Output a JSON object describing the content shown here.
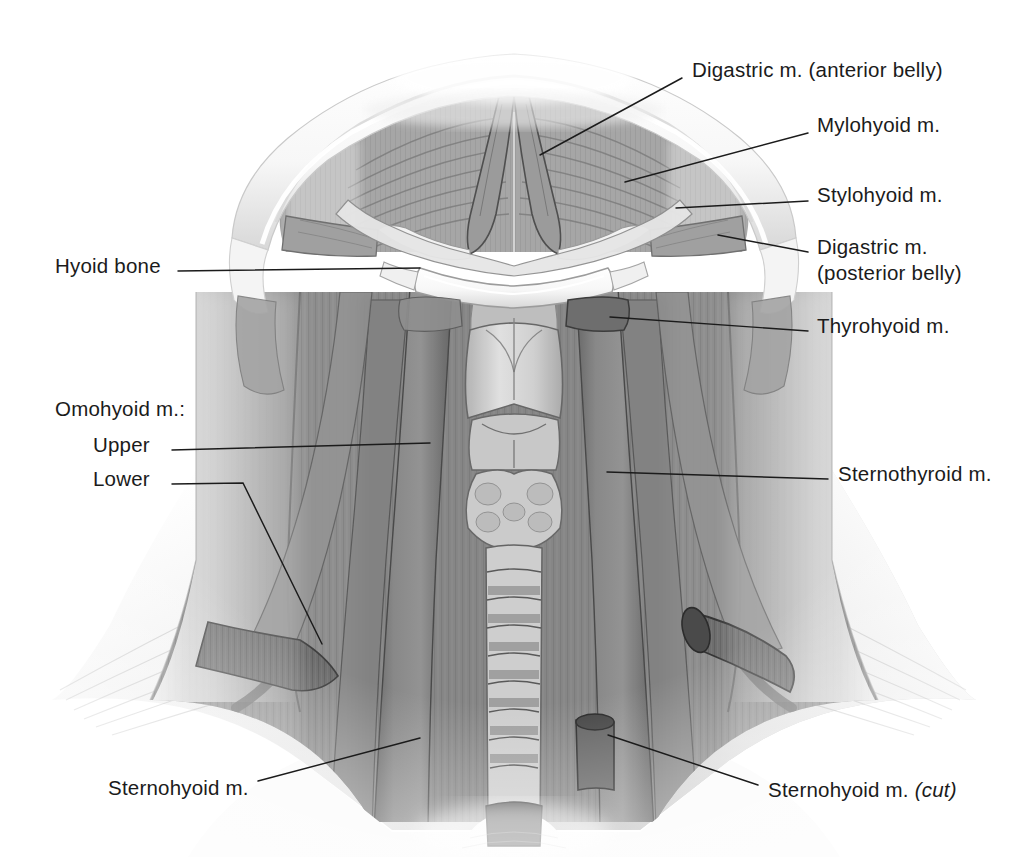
{
  "figure": {
    "background_color": "#ffffff",
    "ink_color": "#1b1b1b",
    "style": "grayscale medical illustration"
  },
  "labels": [
    {
      "id": "digastric-anterior",
      "text": "Digastric m. (anterior belly)",
      "side": "right",
      "x": 692,
      "y": 57,
      "leader": [
        [
          682,
          78
        ],
        [
          540,
          155
        ]
      ]
    },
    {
      "id": "mylohyoid",
      "text": "Mylohyoid m.",
      "side": "right",
      "x": 817,
      "y": 112,
      "leader": [
        [
          808,
          133
        ],
        [
          625,
          182
        ]
      ]
    },
    {
      "id": "stylohyoid",
      "text": "Stylohyoid m.",
      "side": "right",
      "x": 817,
      "y": 182,
      "leader": [
        [
          808,
          201
        ],
        [
          676,
          208
        ]
      ]
    },
    {
      "id": "digastric-posterior",
      "text": "Digastric m.",
      "text_line2": "(posterior belly)",
      "side": "right",
      "x": 817,
      "y": 234,
      "leader": [
        [
          808,
          252
        ],
        [
          718,
          235
        ]
      ]
    },
    {
      "id": "thyrohyoid",
      "text": "Thyrohyoid m.",
      "side": "right",
      "x": 817,
      "y": 313,
      "leader": [
        [
          808,
          331
        ],
        [
          610,
          317
        ]
      ]
    },
    {
      "id": "sternothyroid",
      "text": "Sternothyroid m.",
      "side": "right",
      "x": 838,
      "y": 461,
      "leader": [
        [
          828,
          479
        ],
        [
          607,
          472
        ]
      ]
    },
    {
      "id": "hyoid-bone",
      "text": "Hyoid bone",
      "side": "left",
      "x": 55,
      "y": 253,
      "leader": [
        [
          178,
          271
        ],
        [
          420,
          268
        ]
      ]
    },
    {
      "id": "omohyoid-group",
      "text": "Omohyoid m.:",
      "side": "left",
      "x": 55,
      "y": 396,
      "leader": null
    },
    {
      "id": "omohyoid-upper",
      "text": "Upper",
      "side": "left",
      "x": 93,
      "y": 432,
      "leader": [
        [
          172,
          450
        ],
        [
          430,
          443
        ]
      ]
    },
    {
      "id": "omohyoid-lower",
      "text": "Lower",
      "side": "left",
      "x": 93,
      "y": 466,
      "leader": [
        [
          172,
          484
        ],
        [
          243,
          483
        ],
        [
          322,
          644
        ]
      ]
    },
    {
      "id": "sternohyoid",
      "text": "Sternohyoid m.",
      "side": "left",
      "x": 108,
      "y": 775,
      "leader": [
        [
          258,
          781
        ],
        [
          420,
          738
        ]
      ]
    },
    {
      "id": "sternohyoid-cut",
      "text": "Sternohyoid m. ",
      "text_italic": "(cut)",
      "side": "right",
      "x": 768,
      "y": 777,
      "leader": [
        [
          758,
          785
        ],
        [
          608,
          735
        ]
      ]
    }
  ],
  "anatomy": {
    "structures": [
      {
        "name": "mandible",
        "tone": "#fbfbfb",
        "note": "white bony arch across top"
      },
      {
        "name": "mylohyoid-m",
        "tone": "#a8a8a8",
        "note": "fan of fibers in submental triangle"
      },
      {
        "name": "digastric-anterior-belly",
        "tone": "#9a9a9a",
        "note": "paired midline bellies"
      },
      {
        "name": "digastric-posterior-belly",
        "tone": "#9e9e9e"
      },
      {
        "name": "stylohyoid-m",
        "tone": "#b4b4b4"
      },
      {
        "name": "hyoid-bone",
        "tone": "#f4f4f4",
        "note": "white curved bar"
      },
      {
        "name": "thyrohyoid-m",
        "tone": "#8e8e8e"
      },
      {
        "name": "sternohyoid-m",
        "tone": "#8a8a8a",
        "note": "long strap, paired"
      },
      {
        "name": "sternothyroid-m",
        "tone": "#848484"
      },
      {
        "name": "omohyoid-upper-belly",
        "tone": "#8c8c8c"
      },
      {
        "name": "omohyoid-lower-belly",
        "tone": "#6f6f6f",
        "note": "oblique belly crossing to scapula"
      },
      {
        "name": "sternocleidomastoid-m",
        "tone": "#8f8f8f"
      },
      {
        "name": "thyroid-cartilage",
        "tone": "#dcdcdc"
      },
      {
        "name": "cricoid-cartilage",
        "tone": "#d4d4d4"
      },
      {
        "name": "thyroid-gland",
        "tone": "#d8d8d8"
      },
      {
        "name": "trachea",
        "tone": "#d9d9d9",
        "note": "banded rings in midline"
      },
      {
        "name": "clavicle-shoulder",
        "tone": "#efefef"
      },
      {
        "name": "jugular-notch",
        "tone": "#f6f6f6"
      },
      {
        "name": "cut-muscle-stump",
        "tone": "#5a5a5a",
        "note": "dark oval cut surfaces"
      }
    ]
  }
}
